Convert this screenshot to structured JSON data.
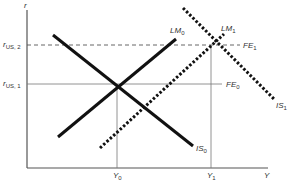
{
  "diagram": {
    "type": "IS-LM-FE",
    "axes": {
      "y_label": "r",
      "x_label": "Y"
    },
    "y_ticks": [
      {
        "label": "r",
        "sub": "US, 2",
        "y": 45
      },
      {
        "label": "r",
        "sub": "US, 1",
        "y": 84
      }
    ],
    "x_ticks": [
      {
        "label": "Y",
        "sub": "0",
        "x": 117
      },
      {
        "label": "Y",
        "sub": "1",
        "x": 211
      }
    ],
    "curves": {
      "IS0": {
        "label": "IS",
        "sub": "0",
        "style": "solid"
      },
      "IS1": {
        "label": "IS",
        "sub": "1",
        "style": "dotted"
      },
      "LM0": {
        "label": "LM",
        "sub": "0",
        "style": "solid"
      },
      "LM1": {
        "label": "LM",
        "sub": "1",
        "style": "dotted"
      },
      "FE0": {
        "label": "FE",
        "sub": "0",
        "style": "thin-solid"
      },
      "FE1": {
        "label": "FE",
        "sub": "1",
        "style": "dashed"
      }
    },
    "colors": {
      "line": "#111111",
      "axis": "#555555",
      "text": "#333333"
    }
  }
}
